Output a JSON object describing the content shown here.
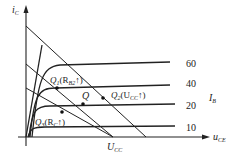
{
  "diagram": {
    "axes": {
      "y_label": "i",
      "y_sub": "C",
      "x_label": "u",
      "x_sub": "CE"
    },
    "curves": [
      {
        "ib": "60"
      },
      {
        "ib": "40"
      },
      {
        "ib": "20"
      },
      {
        "ib": "10"
      }
    ],
    "ib_label": "I",
    "ib_sub": "B",
    "points": {
      "q": "Q",
      "q1": "Q",
      "q1_sub": "1",
      "q1_cond": "(R",
      "q1_cond_sub": "B2",
      "q1_cond_end": "↑)",
      "q2": "Q",
      "q2_sub": "2",
      "q2_cond": "(U",
      "q2_cond_sub": "CC",
      "q2_cond_end": "↑)",
      "q3": "Q",
      "q3_sub": "3",
      "q3_cond": "(R",
      "q3_cond_sub": "C",
      "q3_cond_end": "↑)"
    },
    "ucc_label": "U",
    "ucc_sub": "CC"
  }
}
